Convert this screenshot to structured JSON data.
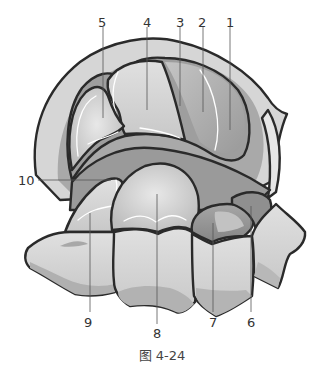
{
  "figure": {
    "caption": "图 4-24",
    "labels": [
      {
        "id": "1",
        "text": "1"
      },
      {
        "id": "2",
        "text": "2"
      },
      {
        "id": "3",
        "text": "3"
      },
      {
        "id": "4",
        "text": "4"
      },
      {
        "id": "5",
        "text": "5"
      },
      {
        "id": "6",
        "text": "6"
      },
      {
        "id": "7",
        "text": "7"
      },
      {
        "id": "8",
        "text": "8"
      },
      {
        "id": "9",
        "text": "9"
      },
      {
        "id": "10",
        "text": "10"
      }
    ],
    "colors": {
      "outline": "#2a2a2a",
      "light": "#d9d9d9",
      "mid": "#b3b3b3",
      "dark": "#8c8c8c",
      "highlight": "#ffffff",
      "background": "#ffffff"
    }
  }
}
